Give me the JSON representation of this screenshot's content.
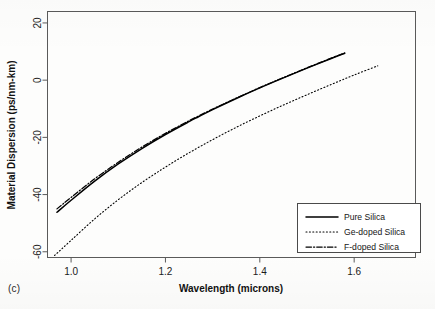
{
  "figure": {
    "panel_label": "(c)"
  },
  "chart_data": {
    "type": "line",
    "title": "",
    "xlabel": "Wavelength (microns)",
    "ylabel": "Material Dispersion (ps/nm-km)",
    "xlim": [
      0.95,
      1.73
    ],
    "ylim": [
      -62,
      24
    ],
    "grid": false,
    "xticks": [
      1.0,
      1.2,
      1.4,
      1.6
    ],
    "xtick_labels": [
      "1.0",
      "1.2",
      "1.4",
      "1.6"
    ],
    "yticks": [
      20,
      0,
      -20,
      -40,
      -60
    ],
    "ytick_labels": [
      "20",
      "0",
      "-20",
      "-40",
      "-60"
    ],
    "legend_position": "lower-right",
    "series": [
      {
        "name": "Pure Silica",
        "style": "solid",
        "color": "#000000",
        "x": [
          0.97,
          1.0,
          1.05,
          1.1,
          1.15,
          1.2,
          1.25,
          1.27,
          1.3,
          1.35,
          1.4,
          1.45,
          1.5,
          1.55,
          1.58
        ],
        "values": [
          -46.2,
          -42.0,
          -35.3,
          -29.3,
          -23.9,
          -19.0,
          -14.5,
          -12.8,
          -10.3,
          -6.4,
          -2.7,
          0.8,
          4.2,
          7.5,
          9.4
        ]
      },
      {
        "name": "Ge-doped Silica",
        "style": "dotted",
        "color": "#000000",
        "x": [
          0.965,
          1.0,
          1.05,
          1.1,
          1.15,
          1.2,
          1.25,
          1.3,
          1.35,
          1.4,
          1.45,
          1.5,
          1.55,
          1.6,
          1.65
        ],
        "values": [
          -61.3,
          -56.0,
          -48.5,
          -41.8,
          -35.8,
          -30.4,
          -25.4,
          -20.8,
          -16.5,
          -12.5,
          -8.7,
          -5.1,
          -1.6,
          1.8,
          5.0
        ]
      },
      {
        "name": "F-doped Silica",
        "style": "dashdot",
        "color": "#000000",
        "x": [
          0.97,
          1.0,
          1.05,
          1.1,
          1.15,
          1.2,
          1.25,
          1.3,
          1.35,
          1.4,
          1.45,
          1.5,
          1.55,
          1.58
        ],
        "values": [
          -45.0,
          -41.0,
          -34.5,
          -28.7,
          -23.4,
          -18.6,
          -14.2,
          -10.1,
          -6.3,
          -2.6,
          0.9,
          4.3,
          7.6,
          9.5
        ]
      }
    ]
  },
  "legend": {
    "entries": [
      {
        "label": "Pure Silica",
        "style": "solid"
      },
      {
        "label": "Ge-doped Silica",
        "style": "dotted"
      },
      {
        "label": "F-doped Silica",
        "style": "dashdot"
      }
    ]
  }
}
